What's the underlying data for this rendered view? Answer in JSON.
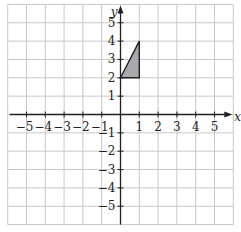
{
  "figure": {
    "type": "coordinate-grid",
    "x_axis_label": "x",
    "y_axis_label": "y",
    "x_range": [
      -6,
      6
    ],
    "y_range": [
      -6,
      6
    ],
    "x_ticks": [
      "-5",
      "-4",
      "-3",
      "-2",
      "-1",
      "1",
      "2",
      "3",
      "4",
      "5"
    ],
    "y_ticks": [
      "5",
      "4",
      "3",
      "2",
      "1",
      "-1",
      "-2",
      "-3",
      "-4",
      "-5"
    ],
    "grid": true,
    "colors": {
      "grid": "#c8c8c8",
      "axis": "#231f20",
      "shape_fill": "#a7a9ac",
      "shape_stroke": "#231f20"
    },
    "shapes": [
      {
        "name": "triangle",
        "vertices": [
          [
            0,
            2
          ],
          [
            1,
            2
          ],
          [
            1,
            4
          ]
        ]
      }
    ]
  }
}
